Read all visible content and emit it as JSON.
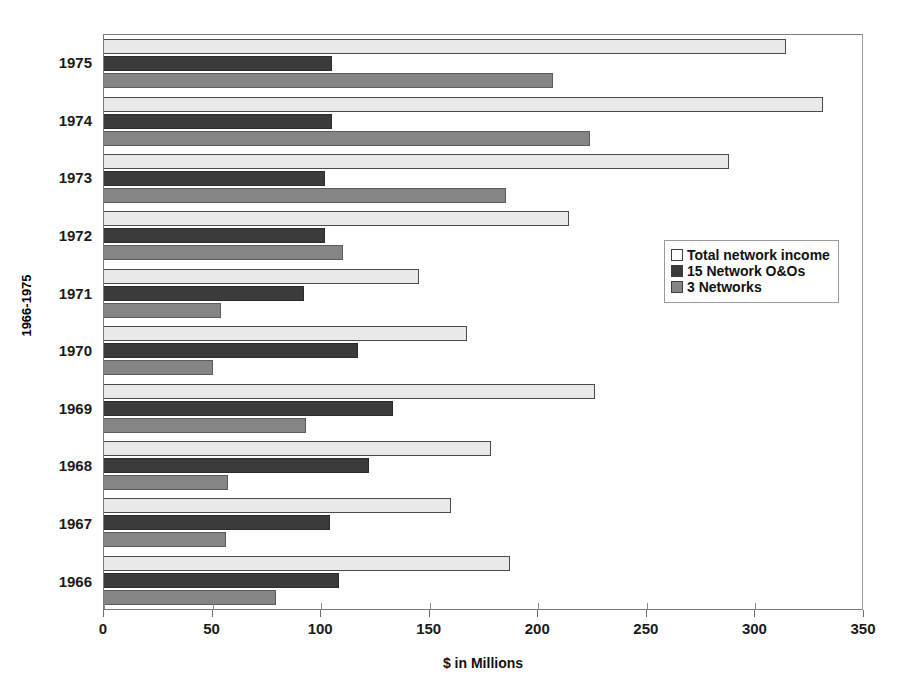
{
  "chart_data": {
    "type": "bar",
    "orientation": "horizontal",
    "title": "",
    "xlabel": "$ in Millions",
    "ylabel": "1966-1975",
    "xlim": [
      0,
      350
    ],
    "xticks": [
      0,
      50,
      100,
      150,
      200,
      250,
      300,
      350
    ],
    "xtick_labels": [
      "0",
      "50",
      "100",
      "150",
      "200",
      "250",
      "300",
      "350"
    ],
    "grid": false,
    "legend_position": "center-right",
    "categories": [
      "1975",
      "1974",
      "1973",
      "1972",
      "1971",
      "1970",
      "1969",
      "1968",
      "1967",
      "1966"
    ],
    "series": [
      {
        "name": "Total network income",
        "color": "#e9e9e9",
        "values": [
          314,
          331,
          288,
          214,
          145,
          167,
          226,
          178,
          160,
          187
        ]
      },
      {
        "name": "15 Network O&Os",
        "color": "#3b3b3b",
        "values": [
          105,
          105,
          102,
          102,
          92,
          117,
          133,
          122,
          104,
          108
        ]
      },
      {
        "name": "3 Networks",
        "color": "#858585",
        "values": [
          207,
          224,
          185,
          110,
          54,
          50,
          93,
          57,
          56,
          79
        ]
      }
    ]
  },
  "legend": {
    "items": [
      {
        "label": "Total network income",
        "swatch": "total"
      },
      {
        "label": "15 Network O&Os",
        "swatch": "oos"
      },
      {
        "label": "3 Networks",
        "swatch": "networks"
      }
    ]
  },
  "colors": {
    "total_network_income": "#e9e9e9",
    "network_ooos": "#3b3b3b",
    "three_networks": "#858585",
    "axis": "#7a7a7a",
    "text": "#111111"
  }
}
